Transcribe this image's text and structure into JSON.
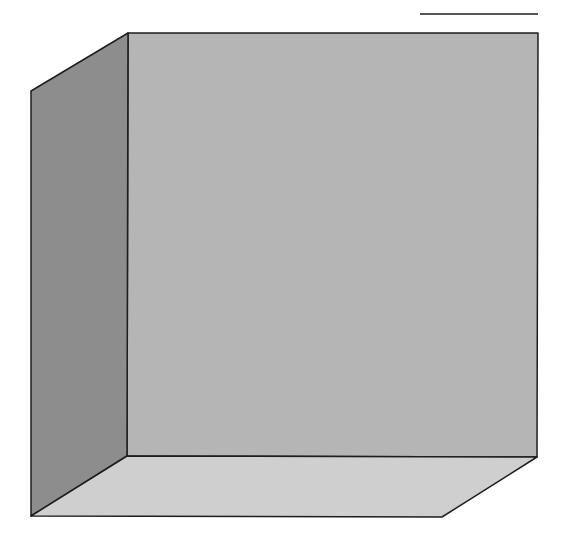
{
  "diagram": {
    "type": "3d-box-plot-area",
    "colors": {
      "background": "#ffffff",
      "back_wall": "#b5b5b5",
      "side_wall": "#8d8d8d",
      "floor": "#cfcfcf",
      "edge": "#1e1e1e"
    },
    "legend_line": {
      "x1": 420,
      "y1": 14,
      "x2": 538,
      "y2": 14
    },
    "back_wall": {
      "points": "128,33 538,33 537,457 127,456"
    },
    "side_wall": {
      "points": "31,91 128,33 127,456 31,516"
    },
    "floor": {
      "points": "31,516 127,456 537,457 442,517"
    }
  }
}
